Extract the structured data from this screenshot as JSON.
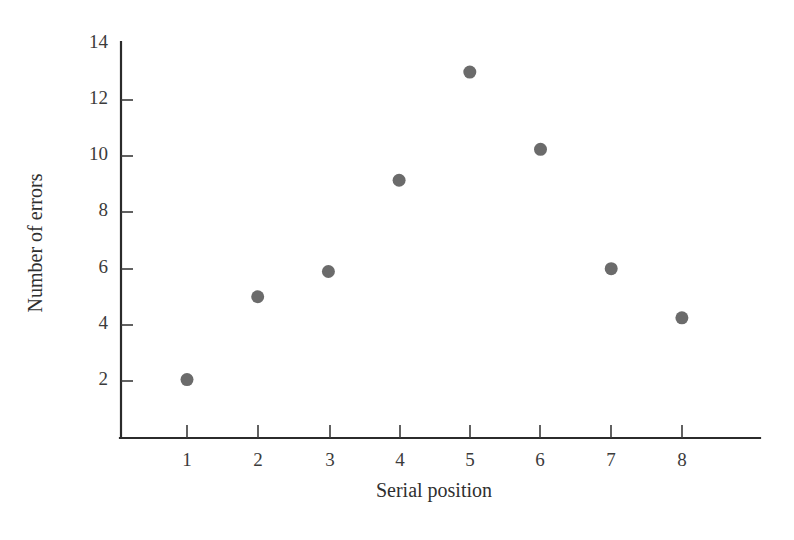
{
  "chart_data": {
    "type": "scatter",
    "title": "",
    "subtitle": "",
    "xlabel": "Serial position",
    "ylabel": "Number of errors",
    "categories": [
      "1",
      "2",
      "3",
      "4",
      "5",
      "6",
      "7",
      "8"
    ],
    "x": [
      1,
      2,
      3,
      4,
      5,
      6,
      7,
      8
    ],
    "values": [
      2.05,
      5.0,
      5.9,
      9.15,
      13.0,
      10.25,
      6.0,
      4.25
    ],
    "series": [
      {
        "name": "Number of errors",
        "values": [
          2.05,
          5.0,
          5.9,
          9.15,
          13.0,
          10.25,
          6.0,
          4.25
        ]
      }
    ],
    "xtick_labels": [
      "1",
      "2",
      "3",
      "4",
      "5",
      "6",
      "7",
      "8"
    ],
    "ytick_labels": [
      "2",
      "4",
      "6",
      "8",
      "10",
      "12",
      "14"
    ],
    "yticks": [
      2,
      4,
      6,
      8,
      10,
      12,
      14
    ],
    "xlim": [
      0.5,
      9.0
    ],
    "ylim": [
      0,
      14
    ],
    "grid": false,
    "legend": false,
    "legend_position": "none",
    "marker_color": "#6b6b6b",
    "marker_size": 13,
    "axis_color": "#2b2b2b",
    "background_color": "#ffffff"
  },
  "figure": {
    "marker_color": "#6b6b6b",
    "axis_color": "#2b2b2b",
    "background_color": "#ffffff"
  }
}
